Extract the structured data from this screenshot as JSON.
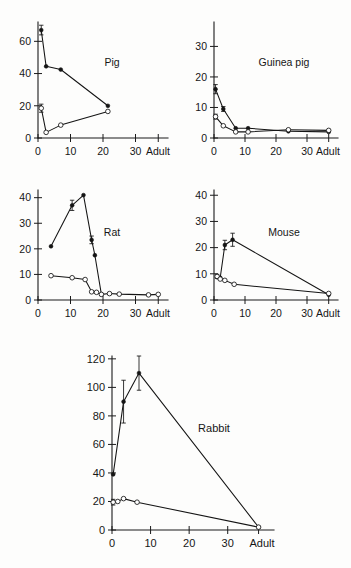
{
  "figure": {
    "name": "multi-species-growth-figure",
    "background": "#fdfdfc",
    "ink": "#141414"
  },
  "chart_data": [
    {
      "id": "pig",
      "type": "line",
      "title": "Pig",
      "xlabel": "",
      "ylabel": "",
      "xlim": [
        0,
        40
      ],
      "ylim": [
        0,
        72
      ],
      "yticks": [
        0,
        20,
        40,
        60
      ],
      "xticks": [
        0,
        10,
        20,
        30
      ],
      "xtick_labels": [
        "0",
        "10",
        "20",
        "30"
      ],
      "adult_label": "Adult",
      "adult_x": 37,
      "grid": false,
      "legend": "none",
      "series": [
        {
          "name": "filled",
          "marker": "filled-circle",
          "x": [
            1.0,
            2.5,
            7.0,
            21.5
          ],
          "y": [
            67.0,
            44.5,
            42.5,
            20.0
          ],
          "yerr": [
            3.0,
            0,
            0,
            0
          ]
        },
        {
          "name": "open",
          "marker": "open-circle",
          "x": [
            1.0,
            2.5,
            7.0,
            21.5
          ],
          "y": [
            18.5,
            3.5,
            8.0,
            16.5
          ],
          "yerr": [
            2.5,
            0,
            0,
            0
          ]
        }
      ]
    },
    {
      "id": "guinea-pig",
      "type": "line",
      "title": "Guinea pig",
      "xlabel": "",
      "ylabel": "",
      "xlim": [
        0,
        40
      ],
      "ylim": [
        0,
        38
      ],
      "yticks": [
        0,
        10,
        20,
        30
      ],
      "xticks": [
        0,
        10,
        20,
        30
      ],
      "xtick_labels": [
        "0",
        "10",
        "20",
        "30"
      ],
      "adult_label": "Adult",
      "adult_x": 37,
      "grid": false,
      "legend": "none",
      "series": [
        {
          "name": "filled",
          "marker": "filled-circle",
          "x": [
            0.5,
            3.0,
            7.0,
            11.0,
            24.0,
            37.0
          ],
          "y": [
            16.0,
            9.5,
            3.2,
            3.2,
            2.2,
            2.0
          ],
          "yerr": [
            1.5,
            0.8,
            0,
            0,
            0,
            0
          ]
        },
        {
          "name": "open",
          "marker": "open-circle",
          "x": [
            0.5,
            3.0,
            7.0,
            11.0,
            24.0,
            37.0
          ],
          "y": [
            7.0,
            4.0,
            2.0,
            2.0,
            2.7,
            2.5
          ],
          "yerr": [
            0.8,
            0,
            0,
            0,
            0,
            0
          ]
        }
      ]
    },
    {
      "id": "rat",
      "type": "line",
      "title": "Rat",
      "xlabel": "",
      "ylabel": "",
      "xlim": [
        0,
        40
      ],
      "ylim": [
        0,
        43
      ],
      "yticks": [
        0,
        10,
        20,
        30,
        40
      ],
      "xticks": [
        0,
        10,
        20,
        30
      ],
      "xtick_labels": [
        "0",
        "10",
        "20",
        "30"
      ],
      "adult_label": "Adult",
      "adult_x": 37,
      "grid": false,
      "legend": "none",
      "series": [
        {
          "name": "filled",
          "marker": "filled-circle",
          "x": [
            4.0,
            10.5,
            14.0,
            16.5,
            17.5,
            19.5
          ],
          "y": [
            21.0,
            37.0,
            41.0,
            23.5,
            17.5,
            2.2
          ],
          "yerr": [
            0,
            2.0,
            0,
            1.5,
            0,
            0
          ]
        },
        {
          "name": "open",
          "marker": "open-circle",
          "x": [
            4.0,
            10.5,
            14.5,
            16.5,
            18.0,
            19.5,
            22.0,
            25.0,
            34.0,
            37.0
          ],
          "y": [
            9.5,
            8.7,
            8.0,
            3.2,
            3.0,
            2.2,
            2.5,
            2.3,
            2.0,
            2.2
          ],
          "yerr": [
            0,
            0,
            0,
            0,
            0,
            0,
            0,
            0,
            0,
            0
          ]
        }
      ]
    },
    {
      "id": "mouse",
      "type": "line",
      "title": "Mouse",
      "xlabel": "",
      "ylabel": "",
      "xlim": [
        0,
        40
      ],
      "ylim": [
        0,
        42
      ],
      "yticks": [
        0,
        10,
        20,
        30,
        40
      ],
      "xticks": [
        0,
        10,
        20,
        30
      ],
      "xtick_labels": [
        "0",
        "10",
        "20",
        "30"
      ],
      "adult_label": "Adult",
      "adult_x": 37,
      "grid": false,
      "legend": "none",
      "series": [
        {
          "name": "filled",
          "marker": "filled-circle",
          "x": [
            1.0,
            2.0,
            3.5,
            6.0,
            37.0
          ],
          "y": [
            8.7,
            8.5,
            21.0,
            23.0,
            2.0
          ],
          "yerr": [
            0,
            0,
            1.8,
            2.5,
            0
          ]
        },
        {
          "name": "open",
          "marker": "open-circle",
          "x": [
            1.0,
            2.0,
            3.5,
            6.5,
            37.0
          ],
          "y": [
            9.0,
            8.0,
            7.5,
            6.0,
            2.5
          ],
          "yerr": [
            0.8,
            0,
            0,
            0,
            0
          ]
        }
      ]
    },
    {
      "id": "rabbit",
      "type": "line",
      "title": "Rabbit",
      "xlabel": "",
      "ylabel": "",
      "xlim": [
        0,
        42
      ],
      "ylim": [
        0,
        122
      ],
      "yticks": [
        0,
        20,
        40,
        60,
        80,
        100,
        120
      ],
      "xticks": [
        0,
        10,
        20,
        30
      ],
      "xtick_labels": [
        "0",
        "10",
        "20",
        "30"
      ],
      "adult_label": "Adult",
      "adult_x": 38,
      "grid": false,
      "legend": "none",
      "series": [
        {
          "name": "filled",
          "marker": "filled-circle",
          "x": [
            0.3,
            3.0,
            7.0,
            38.0
          ],
          "y": [
            39.0,
            90.0,
            110.0,
            2.0
          ],
          "yerr": [
            0,
            15.0,
            12.0,
            0
          ]
        },
        {
          "name": "open",
          "marker": "open-circle",
          "x": [
            0.3,
            1.5,
            3.0,
            6.5,
            38.0
          ],
          "y": [
            19.5,
            20.0,
            22.0,
            19.5,
            2.0
          ],
          "yerr": [
            2.0,
            0,
            0,
            0,
            0
          ]
        }
      ]
    }
  ],
  "panels": [
    {
      "id": "pig",
      "title": "Pig"
    },
    {
      "id": "guinea-pig",
      "title": "Guinea pig"
    },
    {
      "id": "rat",
      "title": "Rat"
    },
    {
      "id": "mouse",
      "title": "Mouse"
    },
    {
      "id": "rabbit",
      "title": "Rabbit"
    }
  ]
}
